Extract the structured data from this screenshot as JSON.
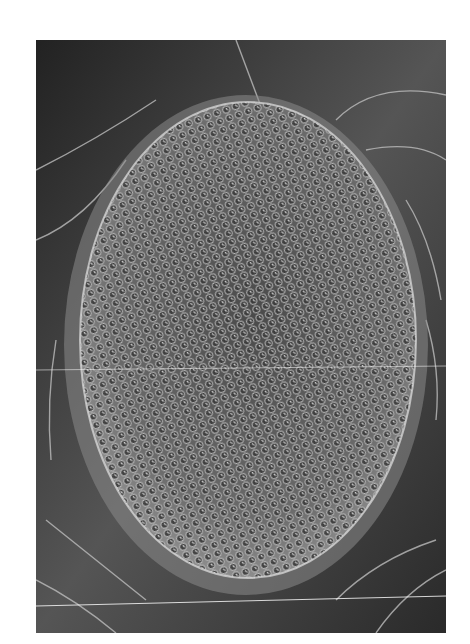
{
  "image": {
    "subject": "Scanning electron micrograph of an insect compound eye",
    "alt": "Grayscale SEM image of a fly's compound eye showing a hexagonal lattice of ommatidia with bristles",
    "colors": {
      "background": "#ffffff",
      "dark": "#1a1a1a",
      "mid": "#6b6b6b",
      "light": "#d9d9d9"
    }
  }
}
